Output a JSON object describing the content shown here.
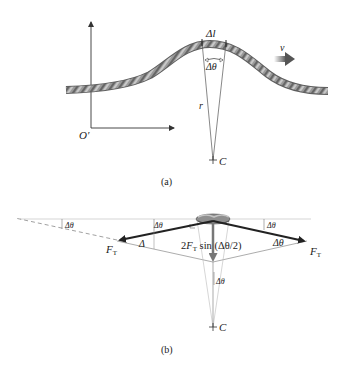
{
  "panel_a": {
    "caption": "(a)",
    "origin_label": "O′",
    "arc_length_label": "Δl",
    "angle_label": "Δθ",
    "radius_label": "r",
    "center_label": "C",
    "velocity_label": "v"
  },
  "panel_b": {
    "caption": "(b)",
    "tension_left_label": "F",
    "tension_left_sub": "T",
    "tension_right_label": "F",
    "tension_right_sub": "T",
    "net_force_prefix": "2",
    "net_force_F": "F",
    "net_force_sub": "T",
    "net_force_suffix": " sin (Δθ/2)",
    "angle_far_left": "Δθ",
    "angle_left_top": "Δθ",
    "angle_left_inner": "Δ",
    "angle_right_top": "Δθ",
    "angle_right_inner": "Δθ",
    "angle_center": "Δθ",
    "center_label": "C"
  },
  "colors": {
    "rope": "#8f8f8f",
    "rope_dark": "#5e5e5e",
    "rope_light": "#c4c4c4",
    "force_vector": "#222222",
    "thin_line": "#9a9a9a",
    "velocity_arrow": "#555555"
  }
}
